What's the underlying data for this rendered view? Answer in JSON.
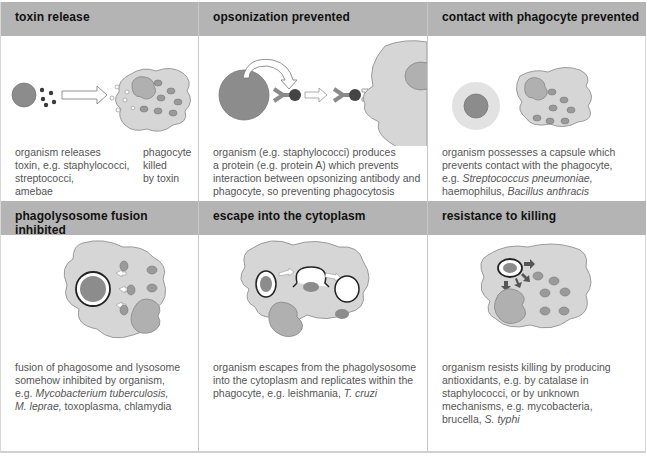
{
  "panels": [
    {
      "id": "toxin-release",
      "title": "toxin release",
      "caption_left": [
        "organism releases",
        "toxin, e.g. staphylococci,",
        "streptococci,",
        "amebae"
      ],
      "caption_right": [
        "phagocyte",
        "killed",
        "by toxin"
      ]
    },
    {
      "id": "opsonization-prevented",
      "title": "opsonization prevented",
      "caption": [
        "organism (e.g. staphylococci) produces",
        "a protein (e.g. protein A) which prevents",
        "interaction between opsonizing antibody and",
        "phagocyte, so preventing phagocytosis"
      ]
    },
    {
      "id": "contact-prevented",
      "title": "contact with phagocyte prevented",
      "caption": [
        "organism possesses a capsule which",
        "prevents contact with the phagocyte,"
      ],
      "caption_italic_line": {
        "prefix": "e.g. ",
        "italic": "Streptococcus pneumoniae,"
      },
      "caption_last": {
        "plain": "haemophilus, ",
        "italic": "Bacillus anthracis"
      }
    },
    {
      "id": "phagolysosome-fusion-inhibited",
      "title": "phagolysosome fusion inhibited",
      "caption": [
        "fusion of phagosome and lysosome",
        "somehow inhibited by organism,"
      ],
      "caption_italic_line": {
        "prefix": "e.g. ",
        "italic": "Mycobacterium tuberculosis,"
      },
      "caption_last": {
        "italic": "M. leprae,",
        "plain": " toxoplasma, chlamydia"
      }
    },
    {
      "id": "escape-into-cytoplasm",
      "title": "escape into the cytoplasm",
      "caption": [
        "organism escapes from the phagolysosome",
        "into the cytoplasm and replicates within the"
      ],
      "caption_last": {
        "plain": "phagocyte, e.g. leishmania, ",
        "italic": "T. cruzi"
      }
    },
    {
      "id": "resistance-to-killing",
      "title": "resistance to killing",
      "caption": [
        "organism resists killing by producing",
        "antioxidants, e.g. by catalase in",
        "staphylococci, or by unknown",
        "mechanisms, e.g. mycobacteria,"
      ],
      "caption_last": {
        "plain": "brucella, ",
        "italic": "S. typhi"
      }
    }
  ],
  "colors": {
    "header_bg": "#b4b4b4",
    "phagocyte_fill": "#d6d6d6",
    "organism_fill": "#8c8c8c",
    "granule_fill": "#9a9a9a",
    "nucleus_fill": "#b0b0b0",
    "toxin_fill": "#3a3a3a"
  }
}
